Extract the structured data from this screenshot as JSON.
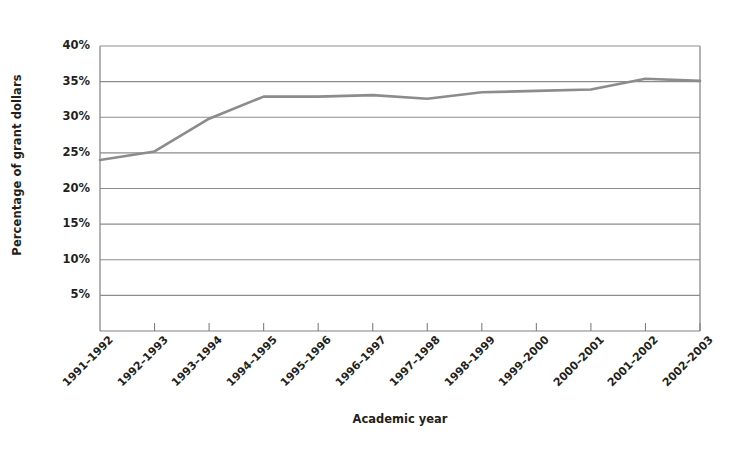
{
  "chart_data": {
    "type": "line",
    "title": "",
    "xlabel": "Academic year",
    "ylabel": "Percentage of grant dollars",
    "categories": [
      "1991–1992",
      "1992–1993",
      "1993–1994",
      "1994–1995",
      "1995–1996",
      "1996–1997",
      "1997–1998",
      "1998–1999",
      "1999–2000",
      "2000–2001",
      "2001–2002",
      "2002–2003"
    ],
    "values": [
      24.0,
      25.2,
      29.8,
      32.9,
      32.9,
      33.1,
      32.6,
      33.5,
      33.7,
      33.9,
      35.4,
      35.1
    ],
    "series": [
      {
        "name": "Percentage of grant dollars",
        "color": "#8c8c8c",
        "values": [
          24.0,
          25.2,
          29.8,
          32.9,
          32.9,
          33.1,
          32.6,
          33.5,
          33.7,
          33.9,
          35.4,
          35.1
        ]
      }
    ],
    "ylim": [
      0,
      40
    ],
    "ytick_values": [
      5,
      10,
      15,
      20,
      25,
      30,
      35,
      40
    ],
    "ytick_labels": [
      "5%",
      "10%",
      "15%",
      "20%",
      "25%",
      "30%",
      "35%",
      "40%"
    ],
    "grid": "horizontal",
    "legend": "none",
    "axis_color": "#808080",
    "grid_color": "#8c8c8c",
    "text_color": "#231f20",
    "background": "#ffffff"
  }
}
